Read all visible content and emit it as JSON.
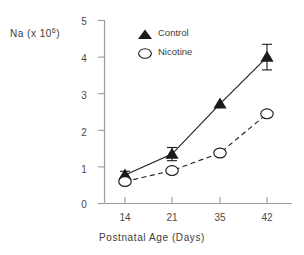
{
  "chart_data": {
    "type": "line",
    "title": "",
    "xlabel": "Postnatal  Age  (Days)",
    "ylabel": "Na  (x  10",
    "ylabel_exponent": "6",
    "ylabel_suffix": ")",
    "categories": [
      "14",
      "21",
      "35",
      "42"
    ],
    "x": [
      14,
      21,
      35,
      42
    ],
    "xlim": [
      10.5,
      46
    ],
    "ylim": [
      0,
      5
    ],
    "yticks": [
      "0",
      "1",
      "2",
      "3",
      "4",
      "5"
    ],
    "ytick_values": [
      0,
      1,
      2,
      3,
      4,
      5
    ],
    "grid": false,
    "legend_position": "upper-left-inside",
    "series": [
      {
        "name": "Control",
        "marker": "filled-triangle",
        "linestyle": "solid",
        "color": "#1a1a1a",
        "values": [
          0.78,
          1.35,
          2.72,
          4.0
        ],
        "errors": [
          0.1,
          0.18,
          0.0,
          0.35
        ]
      },
      {
        "name": "Nicotine",
        "marker": "open-circle",
        "linestyle": "dashed",
        "color": "#1a1a1a",
        "values": [
          0.6,
          0.9,
          1.38,
          2.45
        ],
        "errors": [
          0.0,
          0.0,
          0.0,
          0.0
        ]
      }
    ]
  },
  "legend": {
    "control_label": "Control",
    "nicotine_label": "Nicotine"
  },
  "axes": {
    "y_title_main": "Na  (x  10",
    "y_title_exp": "6",
    "y_title_end": ")",
    "x_title": "Postnatal  Age  (Days)"
  }
}
